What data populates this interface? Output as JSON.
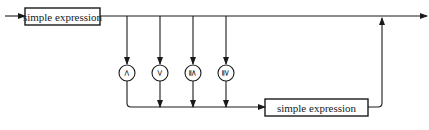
{
  "diagram": {
    "type": "syntax-diagram",
    "title": "",
    "nodes": [
      {
        "id": "simple-expression-1",
        "kind": "nonterminal",
        "label": "simple expression"
      },
      {
        "id": "op-lt",
        "kind": "terminal",
        "label": "<"
      },
      {
        "id": "op-gt",
        "kind": "terminal",
        "label": ">"
      },
      {
        "id": "op-le",
        "kind": "terminal",
        "label": "≦"
      },
      {
        "id": "op-ge",
        "kind": "terminal",
        "label": "≧"
      },
      {
        "id": "simple-expression-2",
        "kind": "nonterminal",
        "label": "simple expression"
      }
    ],
    "edges": [
      {
        "from": "entry",
        "to": "simple-expression-1"
      },
      {
        "from": "simple-expression-1",
        "to": "exit",
        "note": "bypass path"
      },
      {
        "from": "simple-expression-1",
        "to": "op-lt"
      },
      {
        "from": "simple-expression-1",
        "to": "op-gt"
      },
      {
        "from": "simple-expression-1",
        "to": "op-le"
      },
      {
        "from": "simple-expression-1",
        "to": "op-ge"
      },
      {
        "from": "op-lt",
        "to": "simple-expression-2"
      },
      {
        "from": "op-gt",
        "to": "simple-expression-2"
      },
      {
        "from": "op-le",
        "to": "simple-expression-2"
      },
      {
        "from": "op-ge",
        "to": "simple-expression-2"
      },
      {
        "from": "simple-expression-2",
        "to": "exit"
      }
    ],
    "colors": {
      "stroke": "#1a1a1a",
      "background": "#ffffff"
    }
  },
  "labels": {
    "box1": "simple expression",
    "box2": "simple expression",
    "op_lt": "<",
    "op_gt": ">",
    "op_le": "≦",
    "op_ge": "≧"
  }
}
